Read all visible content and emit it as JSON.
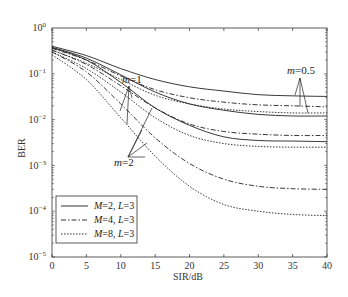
{
  "chart_data": {
    "type": "line",
    "title": "",
    "xlabel": "SIR/dB",
    "ylabel": "BER",
    "xlim": [
      0,
      40
    ],
    "ylim": [
      1e-05,
      1
    ],
    "yscale": "log",
    "grid": false,
    "legend_position": "lower left",
    "x_ticks": [
      "0",
      "5",
      "10",
      "15",
      "20",
      "25",
      "30",
      "35",
      "40"
    ],
    "y_ticks": [
      "10^0",
      "10^-1",
      "10^-2",
      "10^-3",
      "10^-4",
      "10^-5"
    ],
    "x": [
      0,
      5,
      10,
      15,
      20,
      25,
      30,
      35,
      40
    ],
    "legend": [
      {
        "label_M": "M",
        "M": "2",
        "label_L": "L",
        "L": "3",
        "text": "M=2, L=3",
        "style": "solid"
      },
      {
        "label_M": "M",
        "M": "4",
        "label_L": "L",
        "L": "3",
        "text": "M=4, L=3",
        "style": "dashdot"
      },
      {
        "label_M": "M",
        "M": "8",
        "label_L": "L",
        "L": "3",
        "text": "M=8, L=3",
        "style": "dotted"
      }
    ],
    "annotations": [
      {
        "text": "m=1",
        "x": 12,
        "y": 0.12
      },
      {
        "text": "m=0.5",
        "x": 36,
        "y": 0.06
      },
      {
        "text": "m=2",
        "x": 11,
        "y": 0.0012
      }
    ],
    "series": [
      {
        "name": "M=2, L=3, m=0.5",
        "style": "solid",
        "values": [
          0.4,
          0.25,
          0.13,
          0.075,
          0.052,
          0.042,
          0.035,
          0.033,
          0.032
        ]
      },
      {
        "name": "M=4, L=3, m=0.5",
        "style": "dashdot",
        "values": [
          0.36,
          0.2,
          0.09,
          0.045,
          0.03,
          0.024,
          0.021,
          0.02,
          0.019
        ]
      },
      {
        "name": "M=8, L=3, m=0.5",
        "style": "dotted",
        "values": [
          0.33,
          0.17,
          0.075,
          0.034,
          0.022,
          0.017,
          0.015,
          0.014,
          0.014
        ]
      },
      {
        "name": "M=2, L=3, m=1",
        "style": "solid",
        "values": [
          0.38,
          0.22,
          0.095,
          0.04,
          0.022,
          0.016,
          0.013,
          0.012,
          0.012
        ]
      },
      {
        "name": "M=4, L=3, m=1",
        "style": "dashdot",
        "values": [
          0.33,
          0.16,
          0.055,
          0.018,
          0.008,
          0.0055,
          0.0048,
          0.0045,
          0.0045
        ]
      },
      {
        "name": "M=8, L=3, m=1",
        "style": "dotted",
        "values": [
          0.3,
          0.13,
          0.04,
          0.011,
          0.0045,
          0.003,
          0.0026,
          0.0025,
          0.0025
        ]
      },
      {
        "name": "M=2, L=3, m=2",
        "style": "solid",
        "values": [
          0.37,
          0.2,
          0.065,
          0.018,
          0.0075,
          0.0042,
          0.0035,
          0.0034,
          0.0033
        ]
      },
      {
        "name": "M=4, L=3, m=2",
        "style": "dashdot",
        "values": [
          0.3,
          0.11,
          0.022,
          0.004,
          0.0011,
          0.0005,
          0.00035,
          0.00031,
          0.0003
        ]
      },
      {
        "name": "M=8, L=3, m=2",
        "style": "dotted",
        "values": [
          0.26,
          0.075,
          0.011,
          0.0016,
          0.00035,
          0.00014,
          0.0001,
          8.5e-05,
          8e-05
        ]
      }
    ]
  }
}
